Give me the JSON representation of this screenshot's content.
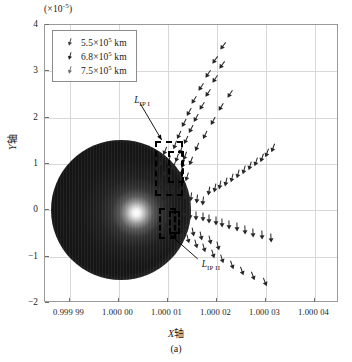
{
  "chart_data": {
    "type": "scatter",
    "title": "",
    "caption": "(a)",
    "xlabel": "X轴",
    "ylabel": "Y轴",
    "y_multiplier": "(×10-5)",
    "y_multiplier_base": "(×10",
    "y_multiplier_exp": "-5",
    "y_multiplier_close": ")",
    "xlim": [
      0.999985,
      1.000045
    ],
    "ylim": [
      -2,
      4
    ],
    "xticks": [
      "0.999 99",
      "1.000 00",
      "1.000 01",
      "1.000 02",
      "1.000 03",
      "1.000 04"
    ],
    "xtick_values": [
      0.99999,
      1.0,
      1.00001,
      1.00002,
      1.00003,
      1.00004
    ],
    "yticks": [
      "4",
      "3",
      "2",
      "1",
      "0",
      "-1",
      "-2"
    ],
    "ytick_values": [
      4,
      3,
      2,
      1,
      0,
      -1,
      -2
    ],
    "grid": true,
    "legend_position": "upper left",
    "series": [
      {
        "name": "5.5×105 km",
        "label_base": "5.5×10",
        "label_exp": "5",
        "label_unit": " km",
        "marker": "arrow",
        "color": "#3a3a3a"
      },
      {
        "name": "6.8×105 km",
        "label_base": "6.8×10",
        "label_exp": "5",
        "label_unit": " km",
        "marker": "arrow-filled",
        "color": "#1a1a1a"
      },
      {
        "name": "7.5×105 km",
        "label_base": "7.5×10",
        "label_exp": "5",
        "label_unit": " km",
        "marker": "arrow-light",
        "color": "#6a6a6a"
      }
    ],
    "planet": {
      "name": "central-body",
      "center_x": 1.0000005,
      "center_y": 0.0,
      "radius_x": 1.47e-05,
      "radius_y": 1.47,
      "glow_center_x": 1.0000093,
      "glow_center_y": -0.15
    },
    "annotations": [
      {
        "name": "L_IP I",
        "label_base": "L",
        "label_sub": "IP I",
        "text_x": 1.0000032,
        "text_y": 2.35,
        "arrow_to_x": 1.0000088,
        "arrow_to_y": 1.52
      },
      {
        "name": "L_IP II",
        "label_base": "L",
        "label_sub": "IP II",
        "text_x": 1.000017,
        "text_y": -1.18,
        "arrow_to_x": 1.0000105,
        "arrow_to_y": -0.52
      }
    ],
    "regions": [
      {
        "name": "L_IP I region box",
        "x0": 1.0000074,
        "x1": 1.0000131,
        "y0": 0.32,
        "y1": 1.5
      },
      {
        "name": "L_IP I inner box",
        "x0": 1.00001,
        "x1": 1.0000134,
        "y0": 0.58,
        "y1": 1.28
      },
      {
        "name": "L_IP II region box",
        "x0": 1.0000083,
        "x1": 1.0000118,
        "y0": -0.62,
        "y1": 0.06
      },
      {
        "name": "L_IP II inner box",
        "x0": 1.0000104,
        "x1": 1.0000126,
        "y0": -0.52,
        "y1": -0.02
      }
    ],
    "points": [
      {
        "x": 1.0000116,
        "y": 1.42,
        "a": 200
      },
      {
        "x": 1.0000128,
        "y": 1.3,
        "a": 200
      },
      {
        "x": 1.0000123,
        "y": 1.63,
        "a": 205
      },
      {
        "x": 1.0000137,
        "y": 1.52,
        "a": 205
      },
      {
        "x": 1.0000133,
        "y": 1.88,
        "a": 208
      },
      {
        "x": 1.0000147,
        "y": 1.76,
        "a": 208
      },
      {
        "x": 1.0000143,
        "y": 2.12,
        "a": 210
      },
      {
        "x": 1.0000158,
        "y": 2.0,
        "a": 210
      },
      {
        "x": 1.0000155,
        "y": 2.38,
        "a": 212
      },
      {
        "x": 1.000017,
        "y": 2.26,
        "a": 212
      },
      {
        "x": 1.0000168,
        "y": 2.66,
        "a": 214
      },
      {
        "x": 1.0000183,
        "y": 2.54,
        "a": 214
      },
      {
        "x": 1.0000182,
        "y": 2.95,
        "a": 215
      },
      {
        "x": 1.0000197,
        "y": 2.83,
        "a": 215
      },
      {
        "x": 1.0000197,
        "y": 3.25,
        "a": 216
      },
      {
        "x": 1.0000212,
        "y": 3.13,
        "a": 216
      },
      {
        "x": 1.0000213,
        "y": 3.55,
        "a": 217
      },
      {
        "x": 1.000016,
        "y": 1.36,
        "a": 203
      },
      {
        "x": 1.0000176,
        "y": 1.63,
        "a": 206
      },
      {
        "x": 1.0000193,
        "y": 1.92,
        "a": 209
      },
      {
        "x": 1.000021,
        "y": 2.22,
        "a": 211
      },
      {
        "x": 1.0000228,
        "y": 2.52,
        "a": 213
      },
      {
        "x": 1.0000103,
        "y": 1.08,
        "a": 198
      },
      {
        "x": 1.0000113,
        "y": 0.96,
        "a": 198
      },
      {
        "x": 1.0000095,
        "y": 0.82,
        "a": 196
      },
      {
        "x": 1.0000106,
        "y": 0.7,
        "a": 196
      },
      {
        "x": 1.0000119,
        "y": 1.12,
        "a": 199
      },
      {
        "x": 1.0000131,
        "y": 1.0,
        "a": 199
      },
      {
        "x": 1.0000136,
        "y": 1.18,
        "a": 201
      },
      {
        "x": 1.0000148,
        "y": 1.06,
        "a": 201
      },
      {
        "x": 1.0000087,
        "y": 0.62,
        "a": 194
      },
      {
        "x": 1.0000098,
        "y": 0.5,
        "a": 194
      },
      {
        "x": 1.0000127,
        "y": 0.82,
        "a": 198
      },
      {
        "x": 1.000014,
        "y": 0.72,
        "a": 198
      },
      {
        "x": 1.0000112,
        "y": 0.44,
        "a": 188
      },
      {
        "x": 1.0000124,
        "y": 0.38,
        "a": 188
      },
      {
        "x": 1.0000136,
        "y": 0.33,
        "a": 187
      },
      {
        "x": 1.0000148,
        "y": 0.28,
        "a": 187
      },
      {
        "x": 1.000016,
        "y": 0.24,
        "a": 186
      },
      {
        "x": 1.0000172,
        "y": 0.2,
        "a": 186
      },
      {
        "x": 1.0000184,
        "y": 0.42,
        "a": 190
      },
      {
        "x": 1.0000196,
        "y": 0.48,
        "a": 191
      },
      {
        "x": 1.0000208,
        "y": 0.55,
        "a": 192
      },
      {
        "x": 1.000022,
        "y": 0.62,
        "a": 193
      },
      {
        "x": 1.0000232,
        "y": 0.7,
        "a": 194
      },
      {
        "x": 1.0000244,
        "y": 0.78,
        "a": 195
      },
      {
        "x": 1.0000256,
        "y": 0.86,
        "a": 196
      },
      {
        "x": 1.0000268,
        "y": 0.95,
        "a": 197
      },
      {
        "x": 1.000028,
        "y": 1.04,
        "a": 198
      },
      {
        "x": 1.0000292,
        "y": 1.14,
        "a": 199
      },
      {
        "x": 1.0000304,
        "y": 1.24,
        "a": 200
      },
      {
        "x": 1.0000316,
        "y": 1.35,
        "a": 201
      },
      {
        "x": 1.000012,
        "y": -0.04,
        "a": 180
      },
      {
        "x": 1.0000133,
        "y": -0.06,
        "a": 180
      },
      {
        "x": 1.0000146,
        "y": -0.09,
        "a": 180
      },
      {
        "x": 1.0000159,
        "y": -0.12,
        "a": 180
      },
      {
        "x": 1.0000172,
        "y": -0.15,
        "a": 180
      },
      {
        "x": 1.0000185,
        "y": -0.19,
        "a": 180
      },
      {
        "x": 1.0000198,
        "y": -0.23,
        "a": 180
      },
      {
        "x": 1.0000211,
        "y": -0.27,
        "a": 179
      },
      {
        "x": 1.0000226,
        "y": -0.32,
        "a": 179
      },
      {
        "x": 1.0000241,
        "y": -0.37,
        "a": 179
      },
      {
        "x": 1.0000258,
        "y": -0.42,
        "a": 178
      },
      {
        "x": 1.0000275,
        "y": -0.48,
        "a": 178
      },
      {
        "x": 1.0000293,
        "y": -0.54,
        "a": 178
      },
      {
        "x": 1.0000312,
        "y": -0.6,
        "a": 177
      },
      {
        "x": 1.0000112,
        "y": -0.44,
        "a": 168
      },
      {
        "x": 1.0000127,
        "y": -0.52,
        "a": 167
      },
      {
        "x": 1.0000142,
        "y": -0.62,
        "a": 166
      },
      {
        "x": 1.0000158,
        "y": -0.72,
        "a": 165
      },
      {
        "x": 1.0000175,
        "y": -0.82,
        "a": 164
      },
      {
        "x": 1.0000193,
        "y": -0.94,
        "a": 163
      },
      {
        "x": 1.0000212,
        "y": -1.06,
        "a": 162
      },
      {
        "x": 1.0000232,
        "y": -1.18,
        "a": 161
      },
      {
        "x": 1.0000253,
        "y": -1.3,
        "a": 160
      },
      {
        "x": 1.0000138,
        "y": -0.38,
        "a": 170
      },
      {
        "x": 1.0000153,
        "y": -0.46,
        "a": 169
      },
      {
        "x": 1.0000169,
        "y": -0.55,
        "a": 168
      },
      {
        "x": 1.0000186,
        "y": -0.65,
        "a": 167
      },
      {
        "x": 1.0000204,
        "y": -0.76,
        "a": 166
      },
      {
        "x": 1.0000275,
        "y": -1.42,
        "a": 159
      },
      {
        "x": 1.0000298,
        "y": -1.55,
        "a": 158
      },
      {
        "x": 1.0000095,
        "y": 1.28,
        "a": 202
      },
      {
        "x": 1.0000086,
        "y": 1.05,
        "a": 200
      },
      {
        "x": 1.0000079,
        "y": 0.88,
        "a": 197
      },
      {
        "x": 1.0000092,
        "y": 0.28,
        "a": 185
      },
      {
        "x": 1.0000099,
        "y": 0.12,
        "a": 182
      },
      {
        "x": 1.0000104,
        "y": -0.02,
        "a": 180
      },
      {
        "x": 1.00001,
        "y": -0.22,
        "a": 174
      },
      {
        "x": 1.0000096,
        "y": -0.38,
        "a": 170
      }
    ]
  }
}
